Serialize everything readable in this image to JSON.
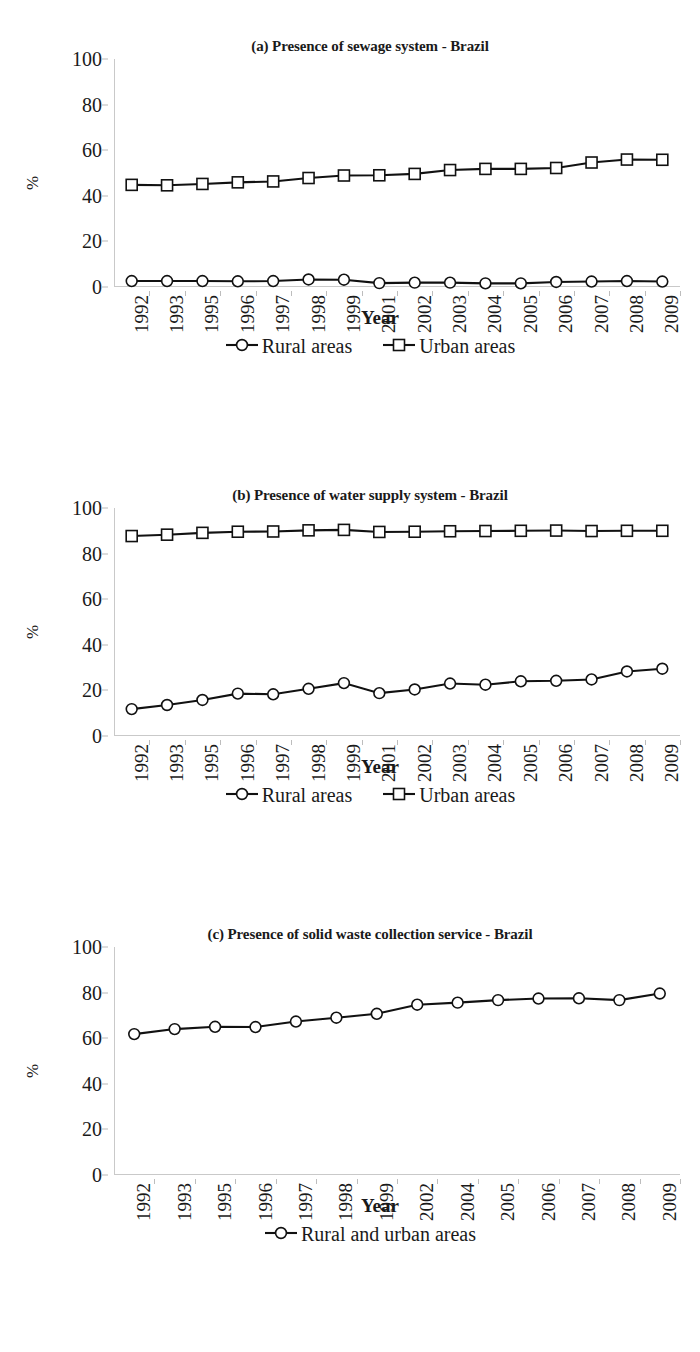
{
  "figure": {
    "axis_y_label": "%",
    "axis_x_label": "Year",
    "y_ticks": [
      "0",
      "20",
      "40",
      "60",
      "80",
      "100"
    ],
    "line_color": "#111111",
    "marker_fill": "#ffffff",
    "axis_color": "#c9c9c9"
  },
  "panels": [
    {
      "title": "(a) Presence of sewage system - Brazil",
      "legend": [
        {
          "label": "Rural areas",
          "marker": "circle"
        },
        {
          "label": "Urban areas",
          "marker": "square"
        }
      ]
    },
    {
      "title": "(b) Presence of water supply system - Brazil",
      "legend": [
        {
          "label": "Rural areas",
          "marker": "circle"
        },
        {
          "label": "Urban areas",
          "marker": "square"
        }
      ]
    },
    {
      "title": "(c) Presence of solid waste collection service - Brazil",
      "legend": [
        {
          "label": "Rural and urban areas",
          "marker": "circle"
        }
      ]
    }
  ],
  "chart_data": [
    {
      "type": "line",
      "title": "(a) Presence of sewage system - Brazil",
      "xlabel": "Year",
      "ylabel": "%",
      "ylim": [
        0,
        100
      ],
      "yticks": [
        0,
        20,
        40,
        60,
        80,
        100
      ],
      "grid": false,
      "legend_position": "bottom",
      "categories": [
        "1992",
        "1993",
        "1995",
        "1996",
        "1997",
        "1998",
        "1999",
        "2001",
        "2002",
        "2003",
        "2004",
        "2005",
        "2006",
        "2007",
        "2008",
        "2009"
      ],
      "series": [
        {
          "name": "Rural areas",
          "marker": "circle",
          "values": [
            2.6,
            2.6,
            2.6,
            2.5,
            2.6,
            3.3,
            3.2,
            1.7,
            1.9,
            1.9,
            1.6,
            1.6,
            2.2,
            2.4,
            2.6,
            2.4
          ]
        },
        {
          "name": "Urban areas",
          "marker": "square",
          "values": [
            44.8,
            44.6,
            45.2,
            45.9,
            46.3,
            47.8,
            48.9,
            49.0,
            49.6,
            51.3,
            51.8,
            51.8,
            52.2,
            54.6,
            55.9,
            55.8
          ]
        }
      ]
    },
    {
      "type": "line",
      "title": "(b) Presence of water supply system - Brazil",
      "xlabel": "Year",
      "ylabel": "%",
      "ylim": [
        0,
        100
      ],
      "yticks": [
        0,
        20,
        40,
        60,
        80,
        100
      ],
      "grid": false,
      "legend_position": "bottom",
      "categories": [
        "1992",
        "1993",
        "1995",
        "1996",
        "1997",
        "1998",
        "1999",
        "2001",
        "2002",
        "2003",
        "2004",
        "2005",
        "2006",
        "2007",
        "2008",
        "2009"
      ],
      "series": [
        {
          "name": "Rural areas",
          "marker": "circle",
          "values": [
            11.8,
            13.6,
            15.8,
            18.6,
            18.3,
            20.7,
            23.2,
            18.8,
            20.4,
            23.0,
            22.5,
            24.0,
            24.2,
            24.8,
            28.3,
            29.5
          ]
        },
        {
          "name": "Urban areas",
          "marker": "square",
          "values": [
            87.7,
            88.3,
            89.1,
            89.6,
            89.7,
            90.2,
            90.4,
            89.5,
            89.6,
            89.8,
            89.9,
            90.0,
            90.1,
            89.9,
            90.0,
            90.0
          ]
        }
      ]
    },
    {
      "type": "line",
      "title": "(c) Presence of solid waste collection service - Brazil",
      "xlabel": "Year",
      "ylabel": "%",
      "ylim": [
        0,
        100
      ],
      "yticks": [
        0,
        20,
        40,
        60,
        80,
        100
      ],
      "grid": false,
      "legend_position": "bottom",
      "categories": [
        "1992",
        "1993",
        "1995",
        "1996",
        "1997",
        "1998",
        "1999",
        "2002",
        "2004",
        "2005",
        "2006",
        "2007",
        "2008",
        "2009"
      ],
      "series": [
        {
          "name": "Rural and urban areas",
          "marker": "circle",
          "values": [
            61.8,
            64.0,
            65.0,
            64.9,
            67.3,
            69.0,
            70.7,
            74.7,
            75.6,
            76.7,
            77.4,
            77.5,
            76.7,
            79.6
          ]
        }
      ]
    }
  ]
}
